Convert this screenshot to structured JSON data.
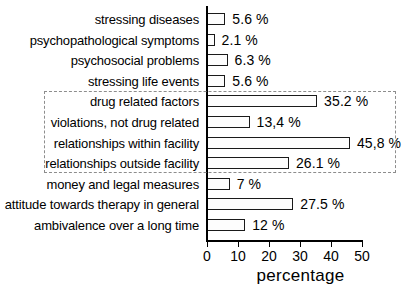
{
  "title_sliver": "································································",
  "chart_data": {
    "type": "bar",
    "orientation": "horizontal",
    "title": "",
    "xlabel": "percentage",
    "ylabel": "",
    "xlim": [
      0,
      50
    ],
    "xticks": [
      0,
      10,
      20,
      30,
      40,
      50
    ],
    "xtick_labels": [
      "0",
      "10",
      "20",
      "30",
      "40",
      "50"
    ],
    "grid": false,
    "legend": null,
    "categories": [
      "stressing diseases",
      "psychopathological symptoms",
      "psychosocial problems",
      "stressing life events",
      "drug related factors",
      "violations, not drug related",
      "relationships within facility",
      "relationships outside facility",
      "money and legal measures",
      "attitude towards therapy in general",
      "ambivalence over a long time"
    ],
    "values": [
      5.6,
      2.1,
      6.3,
      5.6,
      35.2,
      13.4,
      45.8,
      26.1,
      7,
      27.5,
      12
    ],
    "value_labels": [
      "5.6 %",
      "2.1 %",
      "6.3 %",
      "5.6 %",
      "35.2 %",
      "13,4 %",
      "45,8 %",
      "26.1 %",
      "7 %",
      "27.5 %",
      "12 %"
    ],
    "bar_fill_color": "#fdfdfd",
    "bar_edge_color": "#1a1a1a",
    "annotations": [
      {
        "type": "dashed-group-box",
        "label": "",
        "covers": [
          "drug related factors",
          "violations, not drug related",
          "relationships within facility",
          "relationships outside facility"
        ],
        "color": "#8d8d8d"
      }
    ]
  }
}
